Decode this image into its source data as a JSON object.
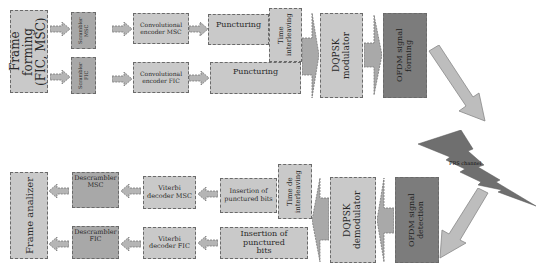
{
  "transmitter": {
    "frame_forming": "Frame forming (FIC, MSC)",
    "scrambler_msc": "Scrambler MSC",
    "scrambler_fic": "Scrambler FIC",
    "conv_encoder_msc": "Convolutional encoder MSC",
    "conv_encoder_fic": "Convolutional encoder FIC",
    "puncturing_msc": "Puncturing",
    "puncturing_fic": "Puncturing",
    "time_interleaving": "Time interleaving",
    "dqpsk_modulator": "DQPSK modulator",
    "ofdm_forming": "OFDM signal forming"
  },
  "channel": {
    "label": "FRS channel"
  },
  "receiver": {
    "frame_analizer": "Frame analizer",
    "descrambler_msc": "Descrambler MSC",
    "descrambler_fic": "Descrambler FIC",
    "viterbi_msc": "Viterbi decoder MSC",
    "viterbi_fic": "Viterbi decoder FIC",
    "insertion_msc": "Insertion of punctured bits",
    "insertion_fic": "Insertion of punctured bits",
    "time_deinterleaving": "Time de interleaving",
    "dqpsk_demodulator": "DQPSK demodulator",
    "ofdm_detection": "OFDM signal detection"
  },
  "colors": {
    "light_block": "#c9c9c9",
    "mid_block": "#a8a8a8",
    "dark_block": "#7c7c7c",
    "lightning": "#6f6f6f",
    "arrow": "#b5b5b5"
  }
}
